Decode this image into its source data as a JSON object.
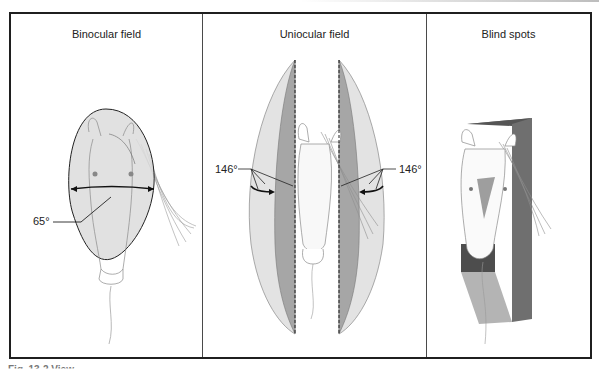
{
  "figure": {
    "panels": [
      {
        "id": "binocular",
        "title": "Binocular field",
        "angle_label": "65°"
      },
      {
        "id": "uniocular",
        "title": "Uniocular field",
        "angle_label_left": "146°",
        "angle_label_right": "146°"
      },
      {
        "id": "blind",
        "title": "Blind spots"
      }
    ],
    "caption": "Fig. 13-2 View..."
  },
  "colors": {
    "frame": "#1f1f1f",
    "field_light": "#dcdcdc",
    "field_mid": "#a9a9a9",
    "field_dark": "#6e6e6e",
    "blind_dark": "#4d4d4d",
    "blind_mid": "#7b7b7b",
    "blind_light": "#b4b4b4"
  }
}
